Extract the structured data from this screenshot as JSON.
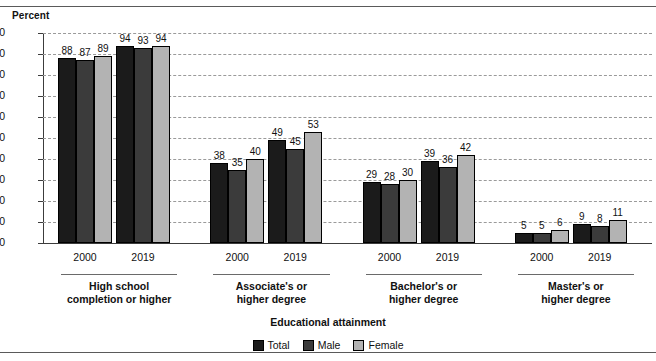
{
  "chart_data": {
    "type": "bar",
    "title": "",
    "ylabel": "Percent",
    "xlabel": "Educational attainment",
    "ylim": [
      0,
      100
    ],
    "yticks": [
      0,
      10,
      20,
      30,
      40,
      50,
      60,
      70,
      80,
      90,
      100
    ],
    "grid": true,
    "legend_position": "bottom-center",
    "series": [
      {
        "name": "Total",
        "color": "#1b1b1b",
        "values": [
          88,
          94,
          38,
          49,
          29,
          39,
          5,
          9
        ]
      },
      {
        "name": "Male",
        "color": "#3b3b3b",
        "values": [
          87,
          93,
          35,
          45,
          28,
          36,
          5,
          8
        ]
      },
      {
        "name": "Female",
        "color": "#b3b3b3",
        "values": [
          89,
          94,
          40,
          53,
          30,
          42,
          6,
          11
        ]
      }
    ],
    "categories": [
      "2000",
      "2019",
      "2000",
      "2019",
      "2000",
      "2019",
      "2000",
      "2019"
    ],
    "groups": [
      {
        "caption_line1": "High school",
        "caption_line2": "completion or higher",
        "periods": [
          "2000",
          "2019"
        ]
      },
      {
        "caption_line1": "Associate's or",
        "caption_line2": "higher degree",
        "periods": [
          "2000",
          "2019"
        ]
      },
      {
        "caption_line1": "Bachelor's or",
        "caption_line2": "higher degree",
        "periods": [
          "2000",
          "2019"
        ]
      },
      {
        "caption_line1": "Master's or",
        "caption_line2": "higher degree",
        "periods": [
          "2000",
          "2019"
        ]
      }
    ]
  },
  "legend": {
    "items": [
      {
        "label": "Total"
      },
      {
        "label": "Male"
      },
      {
        "label": "Female"
      }
    ]
  }
}
